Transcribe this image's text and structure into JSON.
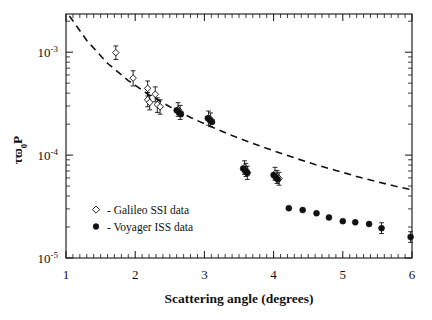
{
  "figure": {
    "xlabel": "Scattering angle (degrees)",
    "ylabel_parts": {
      "tau": "τ",
      "omega": "ϖ",
      "sub": "0",
      "p": "P"
    },
    "ylabel_plain": "τϖ0P"
  },
  "legend": {
    "items": [
      {
        "marker": "open-diamond",
        "label": "- Galileo SSI data"
      },
      {
        "marker": "filled-circle",
        "label": "- Voyager ISS data"
      }
    ]
  },
  "axes": {
    "x_ticks": [
      "1",
      "2",
      "3",
      "4",
      "5",
      "6"
    ],
    "y_ticks": [
      {
        "base": "10",
        "exp": "-3"
      },
      {
        "base": "10",
        "exp": "-4"
      },
      {
        "base": "10",
        "exp": "-5"
      }
    ]
  },
  "chart_data": {
    "type": "scatter",
    "title": "",
    "xlabel": "Scattering angle (degrees)",
    "ylabel": "τϖ₀P",
    "xscale": "linear",
    "yscale": "log",
    "xlim": [
      1,
      6
    ],
    "ylim": [
      1e-05,
      0.00235
    ],
    "grid": false,
    "legend_position": "inside-lower-left",
    "series": [
      {
        "name": "Galileo SSI data",
        "marker": "open-diamond",
        "color": "#111111",
        "points": [
          {
            "x": 1.72,
            "y": 0.00099,
            "yerr_lo": 0.00014,
            "yerr_hi": 0.00016
          },
          {
            "x": 1.97,
            "y": 0.00056,
            "yerr_lo": 9e-05,
            "yerr_hi": 0.0001
          },
          {
            "x": 2.18,
            "y": 0.000445,
            "yerr_lo": 7e-05,
            "yerr_hi": 8e-05
          },
          {
            "x": 2.18,
            "y": 0.000345,
            "yerr_lo": 5e-05,
            "yerr_hi": 6e-05
          },
          {
            "x": 2.21,
            "y": 0.000325,
            "yerr_lo": 5e-05,
            "yerr_hi": 5.5e-05
          },
          {
            "x": 2.29,
            "y": 0.00039,
            "yerr_lo": 6e-05,
            "yerr_hi": 7e-05
          },
          {
            "x": 2.32,
            "y": 0.00031,
            "yerr_lo": 5e-05,
            "yerr_hi": 5e-05
          },
          {
            "x": 2.36,
            "y": 0.000295,
            "yerr_lo": 4.5e-05,
            "yerr_hi": 5e-05
          },
          {
            "x": 2.62,
            "y": 0.000278,
            "yerr_lo": 4e-05,
            "yerr_hi": 4.5e-05
          },
          {
            "x": 2.65,
            "y": 0.000262,
            "yerr_lo": 4e-05,
            "yerr_hi": 4.2e-05
          },
          {
            "x": 3.06,
            "y": 0.00023,
            "yerr_lo": 3.5e-05,
            "yerr_hi": 3.8e-05
          },
          {
            "x": 3.09,
            "y": 0.000222,
            "yerr_lo": 3.3e-05,
            "yerr_hi": 3.5e-05
          },
          {
            "x": 3.58,
            "y": 7.6e-05,
            "yerr_lo": 1.1e-05,
            "yerr_hi": 1.2e-05
          },
          {
            "x": 3.6,
            "y": 7.2e-05,
            "yerr_lo": 1e-05,
            "yerr_hi": 1.1e-05
          },
          {
            "x": 3.62,
            "y": 6.8e-05,
            "yerr_lo": 1e-05,
            "yerr_hi": 1e-05
          },
          {
            "x": 4.02,
            "y": 6.6e-05,
            "yerr_lo": 9e-06,
            "yerr_hi": 1e-05
          },
          {
            "x": 4.05,
            "y": 6.2e-05,
            "yerr_lo": 9e-06,
            "yerr_hi": 9e-06
          },
          {
            "x": 4.08,
            "y": 5.9e-05,
            "yerr_lo": 8e-06,
            "yerr_hi": 9e-06
          }
        ]
      },
      {
        "name": "Voyager ISS data",
        "marker": "filled-circle",
        "color": "#111111",
        "points": [
          {
            "x": 2.6,
            "y": 0.000272
          },
          {
            "x": 2.63,
            "y": 0.00026
          },
          {
            "x": 2.66,
            "y": 0.00025
          },
          {
            "x": 3.05,
            "y": 0.000228
          },
          {
            "x": 3.08,
            "y": 0.000218
          },
          {
            "x": 3.11,
            "y": 0.00021
          },
          {
            "x": 3.56,
            "y": 7.4e-05
          },
          {
            "x": 3.59,
            "y": 7e-05
          },
          {
            "x": 3.62,
            "y": 6.7e-05
          },
          {
            "x": 4.0,
            "y": 6.4e-05
          },
          {
            "x": 4.03,
            "y": 6.1e-05
          },
          {
            "x": 4.06,
            "y": 5.8e-05
          },
          {
            "x": 4.22,
            "y": 3.05e-05
          },
          {
            "x": 4.42,
            "y": 2.92e-05
          },
          {
            "x": 4.62,
            "y": 2.72e-05
          },
          {
            "x": 4.8,
            "y": 2.48e-05
          },
          {
            "x": 5.0,
            "y": 2.28e-05
          },
          {
            "x": 5.18,
            "y": 2.22e-05
          },
          {
            "x": 5.38,
            "y": 2.14e-05
          },
          {
            "x": 5.56,
            "y": 1.95e-05,
            "yerr_lo": 2.2e-06,
            "yerr_hi": 2.5e-06
          },
          {
            "x": 5.98,
            "y": 1.6e-05,
            "yerr_lo": 1.8e-06,
            "yerr_hi": 2e-06
          }
        ]
      }
    ],
    "model_curve": {
      "name": "fitted phase function",
      "style": "dashed",
      "color": "#111111",
      "x": [
        1.05,
        1.3,
        1.6,
        1.9,
        2.2,
        2.5,
        2.8,
        3.1,
        3.4,
        3.7,
        4.0,
        4.3,
        4.6,
        4.9,
        5.2,
        5.5,
        5.75,
        6.0
      ],
      "y": [
        0.00225,
        0.0013,
        0.00078,
        0.00053,
        0.000385,
        0.000295,
        0.000232,
        0.000188,
        0.000155,
        0.00013,
        0.00011,
        9.4e-05,
        8.1e-05,
        7.1e-05,
        6.2e-05,
        5.5e-05,
        5e-05,
        4.6e-05
      ]
    }
  }
}
